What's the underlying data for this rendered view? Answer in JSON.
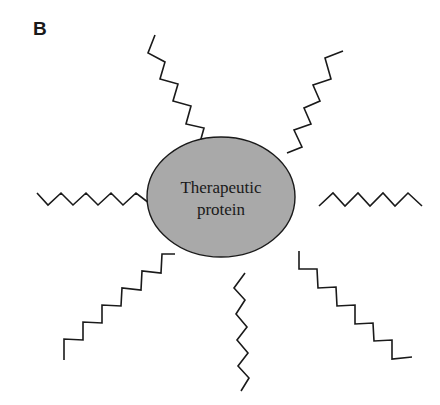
{
  "figure": {
    "panel_label": "B",
    "center": {
      "shape": "ellipse",
      "label_line1": "Therapeutic",
      "label_line2": "protein",
      "fill_color": "#a9a9a9",
      "stroke_color": "#1a1a1a"
    },
    "chains": [
      {
        "name": "top-left-chain",
        "direction": "upper-left"
      },
      {
        "name": "top-right-chain",
        "direction": "upper-right"
      },
      {
        "name": "left-chain",
        "direction": "left"
      },
      {
        "name": "right-chain",
        "direction": "right"
      },
      {
        "name": "bottom-left-chain",
        "direction": "lower-left"
      },
      {
        "name": "bottom-chain",
        "direction": "down"
      },
      {
        "name": "bottom-right-chain",
        "direction": "lower-right"
      }
    ],
    "chain_color": "#1a1a1a"
  }
}
